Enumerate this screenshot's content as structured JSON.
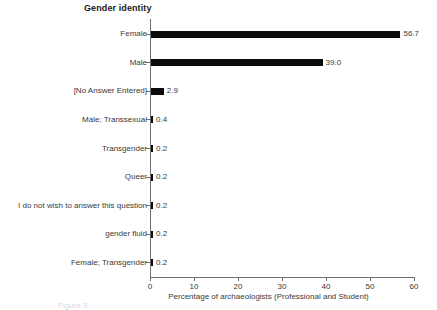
{
  "chart_data": {
    "type": "bar",
    "orientation": "horizontal",
    "title": "Gender identity",
    "xlabel": "Percentage of archaeologists (Professional and Student)",
    "ylabel": "",
    "xlim": [
      0,
      60
    ],
    "xticks": [
      0,
      10,
      20,
      30,
      40,
      50,
      60
    ],
    "xtick_labels": [
      "0",
      "10",
      "20",
      "30",
      "40",
      "50",
      "60"
    ],
    "grid": false,
    "legend": null,
    "categories": [
      "Female",
      "Male",
      "[No Answer Entered]",
      "Male; Transsexual",
      "Transgender",
      "Queer",
      "I do not wish to answer this question",
      "gender fluid",
      "Female; Transgender"
    ],
    "values": [
      56.7,
      39.0,
      2.9,
      0.4,
      0.2,
      0.2,
      0.2,
      0.2,
      0.2
    ],
    "value_labels": [
      "56.7",
      "39.0",
      "2.9",
      "0.4",
      "0.2",
      "0.2",
      "0.2",
      "0.2",
      "0.2"
    ],
    "bar_color": "#0a0a0a",
    "axis_color": "#6e6e6e",
    "text_color": "#3a3a3a",
    "background_color": "#ffffff"
  },
  "caption": {
    "text": "Figure 3"
  }
}
